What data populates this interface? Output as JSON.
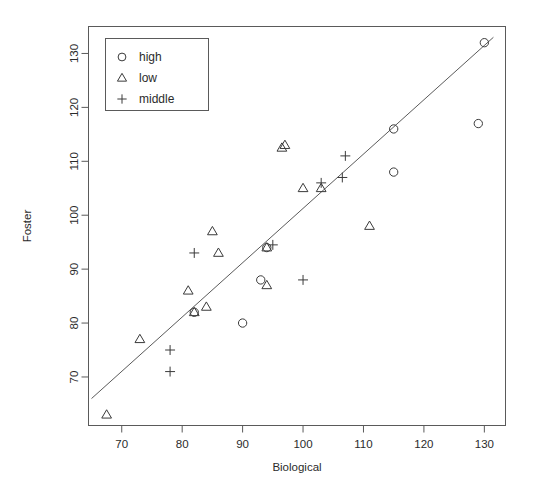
{
  "chart_data": {
    "type": "scatter",
    "title": "",
    "xlabel": "Biological",
    "ylabel": "Foster",
    "xlim": [
      64.5,
      133.5
    ],
    "ylim": [
      61.0,
      135.0
    ],
    "xticks": [
      70,
      80,
      90,
      100,
      110,
      120,
      130
    ],
    "yticks": [
      70,
      80,
      90,
      100,
      110,
      120,
      130
    ],
    "grid": false,
    "legend_position": "top-left",
    "legend": [
      {
        "label": "high",
        "marker": "circle"
      },
      {
        "label": "low",
        "marker": "triangle"
      },
      {
        "label": "middle",
        "marker": "plus"
      }
    ],
    "series": [
      {
        "name": "high",
        "marker": "circle",
        "points": [
          [
            82,
            82
          ],
          [
            90,
            80
          ],
          [
            93,
            88
          ],
          [
            94,
            94
          ],
          [
            115,
            116
          ],
          [
            115,
            108
          ],
          [
            129,
            117
          ],
          [
            130,
            132
          ]
        ]
      },
      {
        "name": "low",
        "marker": "triangle",
        "points": [
          [
            67.5,
            63
          ],
          [
            73,
            77
          ],
          [
            81,
            86
          ],
          [
            82,
            82
          ],
          [
            84,
            83
          ],
          [
            86,
            93
          ],
          [
            85,
            97
          ],
          [
            94,
            87
          ],
          [
            94,
            94
          ],
          [
            96.5,
            112.5
          ],
          [
            97,
            113
          ],
          [
            100,
            105
          ],
          [
            103,
            105
          ],
          [
            111,
            98
          ]
        ]
      },
      {
        "name": "middle",
        "marker": "plus",
        "points": [
          [
            78,
            71
          ],
          [
            78,
            75
          ],
          [
            82,
            93
          ],
          [
            95,
            94.5
          ],
          [
            100,
            88
          ],
          [
            103,
            106
          ],
          [
            106.5,
            107
          ],
          [
            107,
            111
          ]
        ]
      }
    ],
    "reference_line": {
      "description": "diagonal fit line",
      "x_start": 65.0,
      "y_start": 66.0,
      "x_end": 131.5,
      "y_end": 133.0
    }
  }
}
